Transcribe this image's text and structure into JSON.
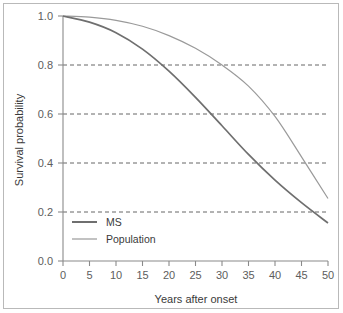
{
  "chart_data": {
    "type": "line",
    "title": "",
    "xlabel": "Years after onset",
    "ylabel": "Survival probability",
    "xlim": [
      0,
      50
    ],
    "ylim": [
      0,
      1.0
    ],
    "xticks": [
      0,
      5,
      10,
      15,
      20,
      25,
      30,
      35,
      40,
      45,
      50
    ],
    "xtick_labels": [
      "0",
      "5",
      "10",
      "15",
      "20",
      "25",
      "30",
      "35",
      "40",
      "45",
      "50"
    ],
    "yticks": [
      0.0,
      0.2,
      0.4,
      0.6,
      0.8,
      1.0
    ],
    "ytick_labels": [
      "0.0",
      "0.2",
      "0.4",
      "0.6",
      "0.8",
      "1.0"
    ],
    "grid": "horizontal-dashed",
    "legend_position": "lower-left",
    "x": [
      0,
      5,
      10,
      15,
      20,
      25,
      30,
      35,
      40,
      45,
      50
    ],
    "series": [
      {
        "name": "MS",
        "color": "#6f6f6f",
        "width": 1.7,
        "values": [
          1.0,
          0.975,
          0.932,
          0.865,
          0.775,
          0.668,
          0.552,
          0.435,
          0.33,
          0.238,
          0.155
        ]
      },
      {
        "name": "Population",
        "color": "#9a9a9a",
        "width": 1.2,
        "values": [
          1.0,
          0.995,
          0.982,
          0.958,
          0.92,
          0.868,
          0.8,
          0.714,
          0.59,
          0.425,
          0.255
        ]
      }
    ],
    "annotations": []
  },
  "legend": {
    "items": [
      {
        "label": "MS"
      },
      {
        "label": "Population"
      }
    ]
  },
  "colors": {
    "frame": "#b9b9b9",
    "axis": "#8a8a8a",
    "grid": "#555555",
    "text": "#3a3a3a",
    "tick_text": "#5d5d5d",
    "background": "#ffffff"
  }
}
